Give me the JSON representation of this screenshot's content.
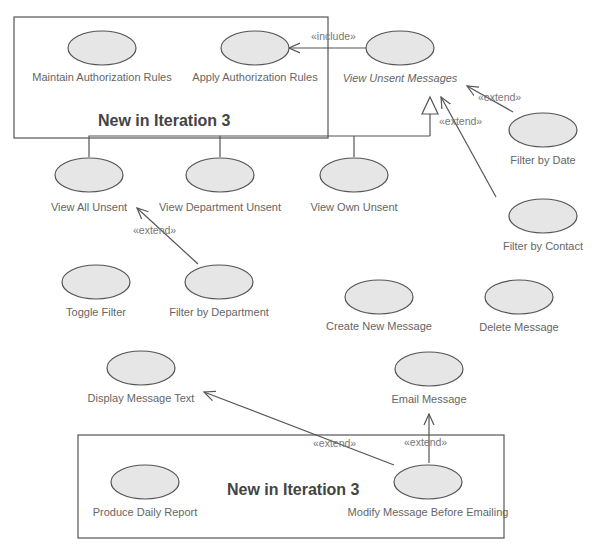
{
  "diagram": {
    "type": "UML use case diagram",
    "colors": {
      "ellipse_fill": "#e6e6e6",
      "stroke": "#555555",
      "text": "#666666"
    },
    "boundaries": [
      {
        "id": "top-box",
        "title": "New in Iteration 3"
      },
      {
        "id": "bottom-box",
        "title": "New in Iteration 3"
      }
    ],
    "use_cases": [
      {
        "id": "maintain-auth",
        "label": "Maintain Authorization Rules"
      },
      {
        "id": "apply-auth",
        "label": "Apply Authorization Rules"
      },
      {
        "id": "view-unsent",
        "label": "View Unsent Messages",
        "abstract": true
      },
      {
        "id": "filter-date",
        "label": "Filter by Date"
      },
      {
        "id": "filter-contact",
        "label": "Filter by Contact"
      },
      {
        "id": "view-all",
        "label": "View All Unsent"
      },
      {
        "id": "view-dept",
        "label": "View Department Unsent"
      },
      {
        "id": "view-own",
        "label": "View Own Unsent"
      },
      {
        "id": "toggle-filter",
        "label": "Toggle Filter"
      },
      {
        "id": "filter-dept",
        "label": "Filter by Department"
      },
      {
        "id": "create-msg",
        "label": "Create New Message"
      },
      {
        "id": "delete-msg",
        "label": "Delete Message"
      },
      {
        "id": "display-text",
        "label": "Display Message Text"
      },
      {
        "id": "email-msg",
        "label": "Email Message"
      },
      {
        "id": "daily-report",
        "label": "Produce Daily Report"
      },
      {
        "id": "modify-msg",
        "label": "Modify Message Before Emailing"
      }
    ],
    "relations": [
      {
        "from": "view-unsent",
        "to": "apply-auth",
        "label": "«include»"
      },
      {
        "from": "filter-date",
        "to": "view-unsent",
        "label": "«extend»"
      },
      {
        "from": "filter-contact",
        "to": "view-unsent",
        "label": "«extend»"
      },
      {
        "from": "filter-dept",
        "to": "view-all",
        "label": "«extend»"
      },
      {
        "from": "modify-msg",
        "to": "display-text",
        "label": "«extend»"
      },
      {
        "from": "modify-msg",
        "to": "email-msg",
        "label": "«extend»"
      },
      {
        "from": "view-all",
        "to": "view-unsent",
        "label": "generalization"
      },
      {
        "from": "view-dept",
        "to": "view-unsent",
        "label": "generalization"
      },
      {
        "from": "view-own",
        "to": "view-unsent",
        "label": "generalization"
      }
    ]
  }
}
